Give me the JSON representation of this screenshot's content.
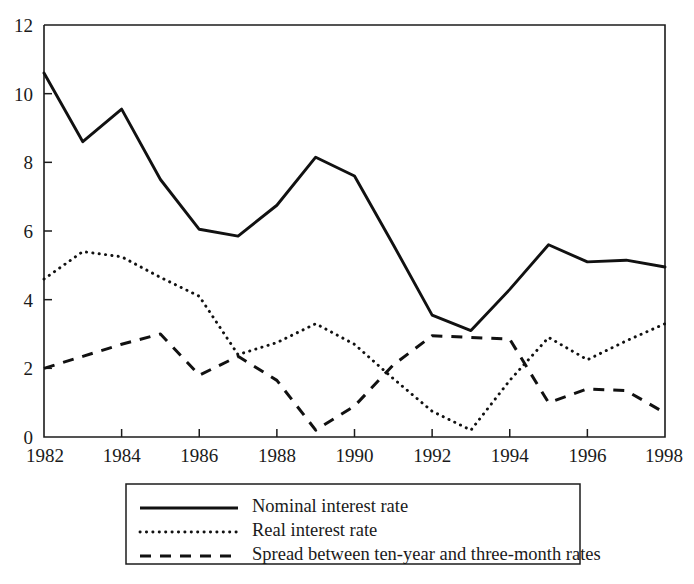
{
  "chart_data": {
    "type": "line",
    "title": "",
    "xlabel": "",
    "ylabel": "",
    "xlim": [
      1982,
      1998
    ],
    "ylim": [
      0,
      12
    ],
    "grid": false,
    "legend_position": "below-plot",
    "x": [
      1982,
      1983,
      1984,
      1985,
      1986,
      1987,
      1988,
      1989,
      1990,
      1991,
      1992,
      1993,
      1994,
      1995,
      1996,
      1997,
      1998
    ],
    "xticks": [
      1982,
      1984,
      1986,
      1988,
      1990,
      1992,
      1994,
      1996,
      1998
    ],
    "xtick_labels": [
      "1982",
      "1984",
      "1986",
      "1988",
      "1990",
      "1992",
      "1994",
      "1996",
      "1998"
    ],
    "yticks": [
      0,
      2,
      4,
      6,
      8,
      10,
      12
    ],
    "ytick_labels": [
      "0",
      "2",
      "4",
      "6",
      "8",
      "10",
      "12"
    ],
    "series": [
      {
        "name": "Nominal interest rate",
        "style": "solid",
        "color": "#111111",
        "values": [
          10.6,
          8.6,
          9.55,
          7.5,
          6.05,
          5.85,
          6.75,
          8.15,
          7.6,
          5.6,
          3.55,
          3.1,
          4.3,
          5.6,
          5.1,
          5.15,
          4.95
        ]
      },
      {
        "name": "Real interest rate",
        "style": "dotted",
        "color": "#111111",
        "values": [
          4.6,
          5.4,
          5.25,
          4.65,
          4.1,
          2.4,
          2.75,
          3.3,
          2.7,
          1.7,
          0.75,
          0.2,
          1.65,
          2.9,
          2.25,
          2.8,
          3.3
        ]
      },
      {
        "name": "Spread between ten-year and three-month rates",
        "style": "dashed",
        "color": "#111111",
        "values": [
          2.0,
          2.35,
          2.7,
          3.0,
          1.8,
          2.35,
          1.65,
          0.2,
          0.9,
          2.1,
          2.95,
          2.9,
          2.85,
          1.0,
          1.4,
          1.35,
          0.7
        ]
      }
    ]
  },
  "legend": {
    "entries": [
      {
        "label": "Nominal interest rate",
        "style": "solid"
      },
      {
        "label": "Real interest rate",
        "style": "dotted"
      },
      {
        "label": "Spread between ten-year and three-month rates",
        "style": "dashed"
      }
    ]
  }
}
